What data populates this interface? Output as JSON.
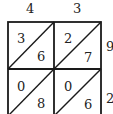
{
  "lattice": {
    "multiplicand_digits": [
      "4",
      "3"
    ],
    "multiplier_digits": [
      "9",
      "2"
    ],
    "cells": [
      [
        {
          "tens": "3",
          "ones": "6"
        },
        {
          "tens": "2",
          "ones": "7"
        }
      ],
      [
        {
          "tens": "0",
          "ones": "8"
        },
        {
          "tens": "0",
          "ones": "6"
        }
      ]
    ]
  }
}
